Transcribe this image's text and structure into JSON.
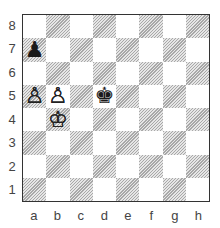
{
  "board": {
    "ranks": [
      "8",
      "7",
      "6",
      "5",
      "4",
      "3",
      "2",
      "1"
    ],
    "files": [
      "a",
      "b",
      "c",
      "d",
      "e",
      "f",
      "g",
      "h"
    ],
    "pieces": [
      {
        "square": "a7",
        "color": "black",
        "type": "pawn",
        "glyph": "♟"
      },
      {
        "square": "a5",
        "color": "white",
        "type": "pawn",
        "glyph": "♙"
      },
      {
        "square": "b5",
        "color": "white",
        "type": "pawn",
        "glyph": "♙"
      },
      {
        "square": "d5",
        "color": "black",
        "type": "king",
        "glyph": "♚"
      },
      {
        "square": "b4",
        "color": "white",
        "type": "king",
        "glyph": "♔"
      }
    ]
  },
  "colors": {
    "light_square": "#ffffff",
    "dark_square_hatch": "#a8a8a8",
    "border": "#333333",
    "label": "#444444"
  }
}
